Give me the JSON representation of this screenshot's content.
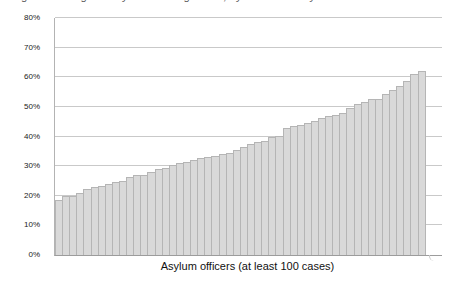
{
  "figure": {
    "clipped_caption": "Fig. Percentage of asylum cases granted, by individual asylum officer"
  },
  "chart_data": {
    "type": "bar",
    "title": "",
    "xlabel": "Asylum officers (at least 100 cases)",
    "ylabel": "",
    "ylim": [
      0,
      80
    ],
    "y_ticks": [
      0,
      10,
      20,
      30,
      40,
      50,
      60,
      70,
      80
    ],
    "y_tick_labels": [
      "0%",
      "10%",
      "20%",
      "30%",
      "40%",
      "50%",
      "60%",
      "70%",
      "80%"
    ],
    "grid": true,
    "legend": "none",
    "x_description": "52 individual asylum officers sorted ascending by grant rate; no per-bar labels shown",
    "values": [
      18.5,
      19.8,
      19.8,
      21,
      22.2,
      23,
      23.2,
      24,
      24.8,
      25,
      26.2,
      27,
      27,
      28.1,
      29,
      29.5,
      30.3,
      31,
      31.5,
      32,
      32.8,
      33,
      33.5,
      34,
      34.5,
      35.5,
      36.5,
      37.5,
      38.2,
      38.6,
      40,
      40.2,
      43,
      43.5,
      44,
      44.5,
      45.2,
      46.2,
      47,
      47.3,
      48,
      49.5,
      51,
      51.5,
      52.5,
      52.8,
      54.5,
      55.6,
      57.2,
      58.9,
      61,
      62
    ]
  },
  "colors": {
    "background": "#ffffff",
    "bar_fill": "#d9d9d9",
    "bar_border": "#b5b5b5",
    "gridline": "#c9c9c9",
    "axis": "#b3b3b3",
    "baseline": "#9c9c9c",
    "text": "#1a1a1a"
  }
}
